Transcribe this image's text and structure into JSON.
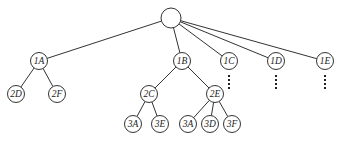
{
  "diagram": {
    "type": "tree",
    "root": {
      "id": "root",
      "label": "",
      "x": 171,
      "y": 18,
      "r": 10
    },
    "nodes": [
      {
        "id": "n1A",
        "label": "1A",
        "x": 39,
        "y": 61,
        "r": 8.5,
        "parent": "root"
      },
      {
        "id": "n1B",
        "label": "1B",
        "x": 182,
        "y": 61,
        "r": 8.5,
        "parent": "root"
      },
      {
        "id": "n1C",
        "label": "1C",
        "x": 229,
        "y": 61,
        "r": 8.5,
        "parent": "root"
      },
      {
        "id": "n1D",
        "label": "1D",
        "x": 276,
        "y": 61,
        "r": 8.5,
        "parent": "root"
      },
      {
        "id": "n1E",
        "label": "1E",
        "x": 325,
        "y": 61,
        "r": 8.5,
        "parent": "root"
      },
      {
        "id": "n2D",
        "label": "2D",
        "x": 16,
        "y": 94,
        "r": 8.5,
        "parent": "n1A"
      },
      {
        "id": "n2F",
        "label": "2F",
        "x": 57,
        "y": 94,
        "r": 8.5,
        "parent": "n1A"
      },
      {
        "id": "n2C",
        "label": "2C",
        "x": 149,
        "y": 94,
        "r": 8.5,
        "parent": "n1B"
      },
      {
        "id": "n2E",
        "label": "2E",
        "x": 215,
        "y": 94,
        "r": 8.5,
        "parent": "n1B"
      },
      {
        "id": "n3A_1",
        "label": "3A",
        "x": 133,
        "y": 124,
        "r": 8.5,
        "parent": "n2C"
      },
      {
        "id": "n3E",
        "label": "3E",
        "x": 160,
        "y": 124,
        "r": 8.5,
        "parent": "n2C"
      },
      {
        "id": "n3A_2",
        "label": "3A",
        "x": 188,
        "y": 124,
        "r": 8.5,
        "parent": "n2E"
      },
      {
        "id": "n3D",
        "label": "3D",
        "x": 210,
        "y": 124,
        "r": 8.5,
        "parent": "n2E"
      },
      {
        "id": "n3F",
        "label": "3F",
        "x": 232,
        "y": 124,
        "r": 8.5,
        "parent": "n2E"
      }
    ],
    "continuations": [
      {
        "under": "n1C",
        "x": 229,
        "symbol": "vertical-ellipsis"
      },
      {
        "under": "n1D",
        "x": 276,
        "symbol": "vertical-ellipsis"
      },
      {
        "under": "n1E",
        "x": 325,
        "symbol": "vertical-ellipsis"
      }
    ]
  }
}
